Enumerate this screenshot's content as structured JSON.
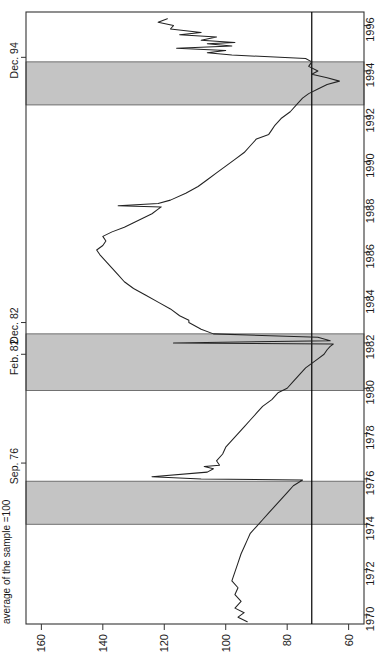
{
  "chart_data": {
    "type": "line",
    "title": "",
    "orientation": "rotated-90",
    "xlabel": "average of the sample = 100",
    "ylabel": "",
    "value_axis": {
      "name": "index",
      "label": "average of the sample = 100",
      "ticks": [
        160,
        140,
        120,
        100,
        80,
        60
      ],
      "tick_labels": [
        "160",
        "140",
        "120",
        "100",
        "80",
        "60"
      ],
      "range": [
        165,
        55
      ],
      "direction": "decreasing-left-to-right"
    },
    "time_axis": {
      "name": "year",
      "ticks": [
        1970,
        1972,
        1974,
        1976,
        1978,
        1980,
        1982,
        1984,
        1986,
        1988,
        1990,
        1992,
        1994,
        1996
      ],
      "tick_labels": [
        "1970",
        "1972",
        "1974",
        "1976",
        "1978",
        "1980",
        "1982",
        "1984",
        "1986",
        "1988",
        "1990",
        "1992",
        "1994",
        "1996"
      ],
      "range": [
        1969.6,
        1996.6
      ],
      "direction": "increasing-bottom-to-top"
    },
    "grid": false,
    "legend": null,
    "reference_line": {
      "name": "vertical-reference-line",
      "value": 72,
      "orientation": "vertical",
      "color": "#000000"
    },
    "shaded_bands": [
      {
        "name": "recession-band-1974-1975",
        "start": 1974.0,
        "end": 1975.9,
        "color": "#c4c4c4"
      },
      {
        "name": "recession-band-1980-1982",
        "start": 1979.9,
        "end": 1982.4,
        "color": "#c4c4c4"
      },
      {
        "name": "recession-band-1992-1994",
        "start": 1992.5,
        "end": 1994.4,
        "color": "#c4c4c4"
      }
    ],
    "annotations": [
      {
        "name": "annotation-dec-94",
        "label": "Dec. 94",
        "year": 1994.6
      },
      {
        "name": "annotation-dec-82",
        "label": "Dec. 82",
        "year": 1982.9
      },
      {
        "name": "annotation-feb-82",
        "label": "Feb. 82",
        "year": 1981.5
      },
      {
        "name": "annotation-sep-76",
        "label": "Sep. 76",
        "year": 1976.7
      }
    ],
    "series": [
      {
        "name": "index-series",
        "color": "#222222",
        "points": [
          [
            1969.7,
            93
          ],
          [
            1969.9,
            96
          ],
          [
            1970.1,
            94
          ],
          [
            1970.3,
            97
          ],
          [
            1970.6,
            95
          ],
          [
            1970.9,
            97
          ],
          [
            1971.2,
            96
          ],
          [
            1971.5,
            98
          ],
          [
            1971.9,
            97
          ],
          [
            1972.3,
            96
          ],
          [
            1972.7,
            95
          ],
          [
            1973.0,
            94
          ],
          [
            1973.3,
            93
          ],
          [
            1973.6,
            92
          ],
          [
            1973.9,
            90
          ],
          [
            1974.2,
            88
          ],
          [
            1974.5,
            86
          ],
          [
            1974.8,
            84
          ],
          [
            1975.1,
            82
          ],
          [
            1975.4,
            80
          ],
          [
            1975.7,
            78
          ],
          [
            1975.95,
            75
          ],
          [
            1976.0,
            108
          ],
          [
            1976.1,
            124
          ],
          [
            1976.3,
            106
          ],
          [
            1976.45,
            104
          ],
          [
            1976.55,
            107
          ],
          [
            1976.6,
            102
          ],
          [
            1976.8,
            103
          ],
          [
            1977.1,
            101
          ],
          [
            1977.4,
            100
          ],
          [
            1977.7,
            98
          ],
          [
            1978.0,
            96
          ],
          [
            1978.3,
            94
          ],
          [
            1978.6,
            92
          ],
          [
            1978.9,
            90
          ],
          [
            1979.2,
            88
          ],
          [
            1979.5,
            85
          ],
          [
            1979.8,
            83
          ],
          [
            1980.0,
            80
          ],
          [
            1980.3,
            78
          ],
          [
            1980.6,
            76
          ],
          [
            1980.9,
            74
          ],
          [
            1981.1,
            72
          ],
          [
            1981.3,
            70
          ],
          [
            1981.5,
            68
          ],
          [
            1981.7,
            67
          ],
          [
            1981.85,
            66
          ],
          [
            1981.95,
            65
          ],
          [
            1982.0,
            117
          ],
          [
            1982.1,
            66
          ],
          [
            1982.25,
            70
          ],
          [
            1982.4,
            104
          ],
          [
            1982.6,
            108
          ],
          [
            1982.9,
            112
          ],
          [
            1983.0,
            112
          ],
          [
            1983.2,
            115
          ],
          [
            1983.5,
            118
          ],
          [
            1983.8,
            122
          ],
          [
            1984.1,
            126
          ],
          [
            1984.4,
            130
          ],
          [
            1984.7,
            133
          ],
          [
            1985.0,
            135
          ],
          [
            1985.3,
            137
          ],
          [
            1985.6,
            139
          ],
          [
            1985.9,
            141
          ],
          [
            1986.1,
            142
          ],
          [
            1986.3,
            140
          ],
          [
            1986.5,
            139
          ],
          [
            1986.7,
            140
          ],
          [
            1986.9,
            137
          ],
          [
            1987.1,
            133
          ],
          [
            1987.3,
            130
          ],
          [
            1987.5,
            127
          ],
          [
            1987.7,
            124
          ],
          [
            1987.9,
            122
          ],
          [
            1988.0,
            121
          ],
          [
            1988.05,
            135
          ],
          [
            1988.15,
            122
          ],
          [
            1988.3,
            118
          ],
          [
            1988.6,
            113
          ],
          [
            1988.9,
            109
          ],
          [
            1989.2,
            106
          ],
          [
            1989.5,
            103
          ],
          [
            1989.8,
            100
          ],
          [
            1990.1,
            97
          ],
          [
            1990.4,
            94
          ],
          [
            1990.7,
            92
          ],
          [
            1991.0,
            90
          ],
          [
            1991.2,
            86
          ],
          [
            1991.4,
            85
          ],
          [
            1991.6,
            84
          ],
          [
            1991.9,
            82
          ],
          [
            1992.2,
            79
          ],
          [
            1992.5,
            77
          ],
          [
            1992.8,
            75
          ],
          [
            1993.0,
            73
          ],
          [
            1993.2,
            70
          ],
          [
            1993.4,
            67
          ],
          [
            1993.55,
            63
          ],
          [
            1993.7,
            67
          ],
          [
            1993.85,
            72
          ],
          [
            1994.0,
            70
          ],
          [
            1994.2,
            73
          ],
          [
            1994.4,
            72
          ],
          [
            1994.55,
            74
          ],
          [
            1994.7,
            98
          ],
          [
            1994.8,
            106
          ],
          [
            1994.9,
            100
          ],
          [
            1995.0,
            116
          ],
          [
            1995.1,
            98
          ],
          [
            1995.2,
            106
          ],
          [
            1995.25,
            97
          ],
          [
            1995.35,
            108
          ],
          [
            1995.5,
            103
          ],
          [
            1995.6,
            115
          ],
          [
            1995.7,
            108
          ],
          [
            1995.85,
            118
          ],
          [
            1996.0,
            117
          ],
          [
            1996.15,
            122
          ],
          [
            1996.3,
            119
          ]
        ]
      }
    ]
  },
  "axis": {
    "value_title": "average of the sample =100"
  }
}
